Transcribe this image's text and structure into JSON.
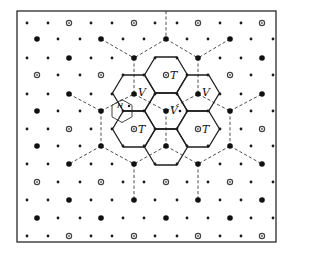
{
  "figure": {
    "width": 297,
    "height": 256,
    "frame": {
      "x": 17,
      "y": 11,
      "w": 259,
      "h": 231
    },
    "lattice": {
      "row_y": [
        23,
        39,
        58,
        75,
        94,
        111,
        129,
        146,
        164,
        182,
        200,
        218,
        236
      ],
      "even_row_x": [
        27,
        48,
        69,
        91,
        112,
        134,
        155,
        177,
        198,
        220,
        241,
        262
      ],
      "odd_row_x": [
        37,
        58,
        80,
        101,
        123,
        144,
        166,
        187,
        208,
        230,
        251,
        273
      ],
      "special_site_type_by_row": [
        "ring",
        "big",
        "big",
        "ring",
        "big",
        "big",
        "ring",
        "big",
        "big",
        "ring",
        "big",
        "big",
        "ring"
      ],
      "legend_note": "small dots = ordinary lattice sites; large filled dots and open rings mark special sites every third position"
    },
    "dashed_lines": [
      [
        166,
        11,
        166,
        39
      ],
      [
        166,
        39,
        134,
        58
      ],
      [
        166,
        39,
        198,
        58
      ],
      [
        101,
        39,
        134,
        58
      ],
      [
        230,
        39,
        198,
        58
      ],
      [
        134,
        58,
        134,
        94
      ],
      [
        198,
        58,
        198,
        94
      ],
      [
        69,
        94,
        101,
        111
      ],
      [
        101,
        111,
        134,
        94
      ],
      [
        134,
        94,
        166,
        111
      ],
      [
        198,
        94,
        166,
        111
      ],
      [
        198,
        94,
        230,
        111
      ],
      [
        230,
        111,
        262,
        94
      ],
      [
        101,
        111,
        101,
        146
      ],
      [
        166,
        111,
        166,
        146
      ],
      [
        230,
        111,
        230,
        146
      ],
      [
        101,
        146,
        69,
        164
      ],
      [
        101,
        146,
        134,
        164
      ],
      [
        166,
        146,
        134,
        164
      ],
      [
        166,
        146,
        198,
        164
      ],
      [
        230,
        146,
        198,
        164
      ],
      [
        230,
        146,
        262,
        164
      ],
      [
        134,
        164,
        134,
        200
      ],
      [
        198,
        164,
        198,
        200
      ]
    ],
    "hexagons": {
      "half_width": 21.5,
      "half_height": 18,
      "centers": [
        [
          166,
          75
        ],
        [
          134,
          93
        ],
        [
          198,
          93
        ],
        [
          166,
          111
        ],
        [
          134,
          129
        ],
        [
          198,
          129
        ],
        [
          166,
          147
        ]
      ]
    },
    "small_hexagon": {
      "cx": 122,
      "cy": 111,
      "r": 11.5
    },
    "labels": [
      {
        "text": "T",
        "x": 170,
        "y": 79,
        "kind": "T"
      },
      {
        "text": "T",
        "x": 138,
        "y": 133,
        "kind": "T"
      },
      {
        "text": "T",
        "x": 202,
        "y": 133,
        "kind": "T"
      },
      {
        "text": "V",
        "x": 138,
        "y": 96,
        "kind": "V"
      },
      {
        "text": "V",
        "x": 202,
        "y": 96,
        "kind": "V"
      },
      {
        "text": "V",
        "x": 170,
        "y": 114,
        "kind": "V"
      },
      {
        "text": "H",
        "x": 117,
        "y": 108,
        "kind": "H"
      }
    ]
  }
}
